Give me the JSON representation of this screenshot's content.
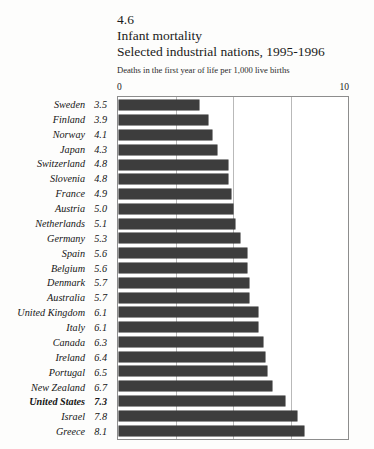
{
  "figure": {
    "number": "4.6",
    "title": "Infant mortality",
    "subtitle": "Selected industrial nations, 1995-1996",
    "units": "Deaths in the first year of life per 1,000 live births"
  },
  "axis": {
    "min_label": "0",
    "max_label": "10"
  },
  "chart_data": {
    "type": "bar",
    "orientation": "horizontal",
    "title": "Infant mortality",
    "subtitle": "Selected industrial nations, 1995-1996",
    "xlabel": "Deaths in the first year of life per 1,000 live births",
    "ylabel": "",
    "xlim": [
      0,
      10
    ],
    "xticks": [
      0,
      10
    ],
    "gridlines": [
      2.5,
      5.0,
      7.5
    ],
    "grid": true,
    "legend": "none",
    "bar_color": "#3d3d3d",
    "highlight_category": "United States",
    "categories": [
      "Sweden",
      "Finland",
      "Norway",
      "Japan",
      "Switzerland",
      "Slovenia",
      "France",
      "Austria",
      "Netherlands",
      "Germany",
      "Spain",
      "Belgium",
      "Denmark",
      "Australia",
      "United Kingdom",
      "Italy",
      "Canada",
      "Ireland",
      "Portugal",
      "New Zealand",
      "United States",
      "Israel",
      "Greece"
    ],
    "values": [
      3.5,
      3.9,
      4.1,
      4.3,
      4.8,
      4.8,
      4.9,
      5.0,
      5.1,
      5.3,
      5.6,
      5.6,
      5.7,
      5.7,
      6.1,
      6.1,
      6.3,
      6.4,
      6.5,
      6.7,
      7.3,
      7.8,
      8.1
    ],
    "value_labels": [
      "3.5",
      "3.9",
      "4.1",
      "4.3",
      "4.8",
      "4.8",
      "4.9",
      "5.0",
      "5.1",
      "5.3",
      "5.6",
      "5.6",
      "5.7",
      "5.7",
      "6.1",
      "6.1",
      "6.3",
      "6.4",
      "6.5",
      "6.7",
      "7.3",
      "7.8",
      "8.1"
    ]
  }
}
